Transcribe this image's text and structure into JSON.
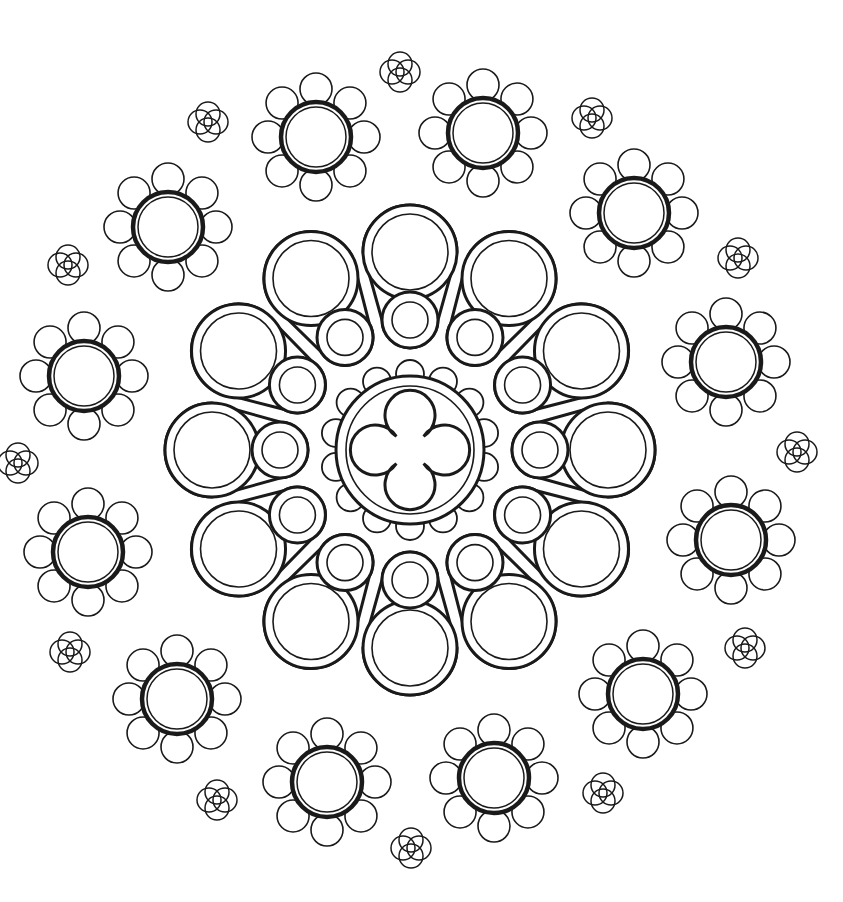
{
  "image": {
    "subject": "rose-window-line-art",
    "background": "#ffffff",
    "stroke": "#1a1a1a",
    "center": [
      410,
      450
    ],
    "center_medallion": {
      "r_outer": 74,
      "r_inner": 64,
      "scallops": 14,
      "scallop_r": 14,
      "motif": "quatrefoil"
    },
    "inner_petals": {
      "count": 12,
      "big_r": 40,
      "big_dist": 198,
      "small_r": 22,
      "small_dist": 130
    },
    "outer_flowers": [
      [
        316,
        137
      ],
      [
        483,
        133
      ],
      [
        634,
        213
      ],
      [
        726,
        362
      ],
      [
        731,
        540
      ],
      [
        643,
        694
      ],
      [
        494,
        778
      ],
      [
        327,
        782
      ],
      [
        177,
        699
      ],
      [
        88,
        552
      ],
      [
        84,
        376
      ],
      [
        168,
        227
      ]
    ],
    "flower": {
      "r": 35,
      "petal_r": 16,
      "petal_dist": 48,
      "petals": 8
    },
    "knots": [
      [
        400,
        72
      ],
      [
        592,
        118
      ],
      [
        738,
        258
      ],
      [
        797,
        452
      ],
      [
        745,
        648
      ],
      [
        603,
        793
      ],
      [
        411,
        848
      ],
      [
        217,
        800
      ],
      [
        70,
        652
      ],
      [
        18,
        463
      ],
      [
        68,
        265
      ],
      [
        208,
        122
      ]
    ],
    "knot": {
      "r": 12,
      "offset": 8
    }
  }
}
